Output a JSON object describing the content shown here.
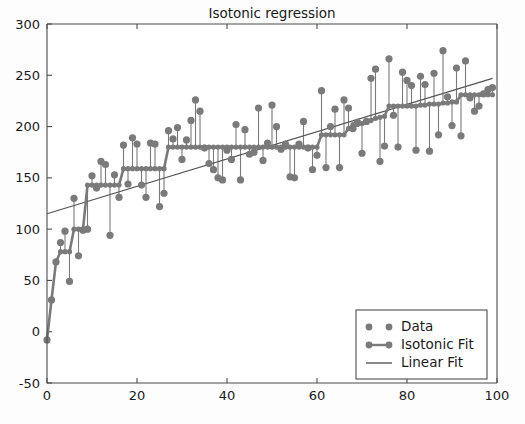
{
  "chart_data": {
    "type": "scatter",
    "title": "Isotonic regression",
    "xlabel": "",
    "ylabel": "",
    "xlim": [
      0,
      100
    ],
    "ylim": [
      -50,
      300
    ],
    "grid": false,
    "legend_position": "lower right",
    "xticks": [
      0,
      20,
      40,
      60,
      80,
      100
    ],
    "yticks": [
      -50,
      0,
      50,
      100,
      150,
      200,
      250,
      300
    ],
    "xtick_labels": [
      "0",
      "20",
      "40",
      "60",
      "80",
      "100"
    ],
    "ytick_labels": [
      "-50",
      "0",
      "50",
      "100",
      "150",
      "200",
      "250",
      "300"
    ],
    "marker_color": "#7a7a7a",
    "line_color": "#7a7a7a",
    "linear_fit_color": "#555555",
    "legend": [
      {
        "label": "Data",
        "style": "markers-only",
        "color": "#7a7a7a"
      },
      {
        "label": "Isotonic Fit",
        "style": "markers-with-line",
        "color": "#7a7a7a"
      },
      {
        "label": "Linear Fit",
        "style": "line-only",
        "color": "#555555"
      }
    ],
    "series": [
      {
        "name": "Data",
        "x": [
          0,
          1,
          2,
          3,
          4,
          5,
          6,
          7,
          8,
          9,
          10,
          11,
          12,
          13,
          14,
          15,
          16,
          17,
          18,
          19,
          20,
          21,
          22,
          23,
          24,
          25,
          26,
          27,
          28,
          29,
          30,
          31,
          32,
          33,
          34,
          35,
          36,
          37,
          38,
          39,
          40,
          41,
          42,
          43,
          44,
          45,
          46,
          47,
          48,
          49,
          50,
          51,
          52,
          53,
          54,
          55,
          56,
          57,
          58,
          59,
          60,
          61,
          62,
          63,
          64,
          65,
          66,
          67,
          68,
          69,
          70,
          71,
          72,
          73,
          74,
          75,
          76,
          77,
          78,
          79,
          80,
          81,
          82,
          83,
          84,
          85,
          86,
          87,
          88,
          89,
          90,
          91,
          92,
          93,
          94,
          95,
          96,
          97,
          98,
          99
        ],
        "y": [
          -8,
          31,
          68,
          87,
          98,
          49,
          130,
          74,
          99,
          100,
          152,
          140,
          166,
          163,
          94,
          153,
          131,
          182,
          144,
          189,
          183,
          143,
          131,
          184,
          183,
          122,
          135,
          196,
          188,
          199,
          168,
          187,
          206,
          226,
          215,
          179,
          164,
          158,
          150,
          148,
          177,
          168,
          202,
          148,
          197,
          173,
          175,
          218,
          167,
          184,
          221,
          200,
          178,
          183,
          151,
          150,
          183,
          205,
          179,
          158,
          172,
          235,
          160,
          200,
          217,
          160,
          226,
          218,
          198,
          204,
          174,
          205,
          247,
          256,
          166,
          181,
          266,
          211,
          180,
          253,
          245,
          240,
          177,
          249,
          241,
          176,
          252,
          192,
          274,
          229,
          201,
          257,
          191,
          264,
          228,
          215,
          220,
          232,
          236,
          238
        ]
      },
      {
        "name": "Isotonic Fit",
        "x": [
          0,
          1,
          2,
          3,
          4,
          5,
          6,
          7,
          8,
          9,
          10,
          11,
          12,
          13,
          14,
          15,
          16,
          17,
          18,
          19,
          20,
          21,
          22,
          23,
          24,
          25,
          26,
          27,
          28,
          29,
          30,
          31,
          32,
          33,
          34,
          35,
          36,
          37,
          38,
          39,
          40,
          41,
          42,
          43,
          44,
          45,
          46,
          47,
          48,
          49,
          50,
          51,
          52,
          53,
          54,
          55,
          56,
          57,
          58,
          59,
          60,
          61,
          62,
          63,
          64,
          65,
          66,
          67,
          68,
          69,
          70,
          71,
          72,
          73,
          74,
          75,
          76,
          77,
          78,
          79,
          80,
          81,
          82,
          83,
          84,
          85,
          86,
          87,
          88,
          89,
          90,
          91,
          92,
          93,
          94,
          95,
          96,
          97,
          98,
          99
        ],
        "y": [
          -8,
          31,
          68,
          78,
          78,
          78,
          100,
          100,
          100,
          143,
          143,
          143,
          143,
          143,
          143,
          143,
          143,
          159,
          159,
          159,
          159,
          159,
          159,
          159,
          159,
          159,
          159,
          180,
          180,
          180,
          180,
          180,
          180,
          180,
          180,
          180,
          180,
          180,
          180,
          180,
          180,
          180,
          180,
          180,
          180,
          180,
          180,
          180,
          180,
          180,
          180,
          180,
          180,
          180,
          180,
          180,
          180,
          180,
          180,
          180,
          180,
          192,
          192,
          192,
          192,
          192,
          192,
          198,
          202,
          202,
          203,
          204,
          206,
          208,
          209,
          210,
          220,
          220,
          220,
          220,
          220,
          220,
          220,
          221,
          221,
          222,
          222,
          222,
          223,
          223,
          224,
          224,
          231,
          231,
          231,
          231,
          231,
          231,
          231,
          231
        ]
      },
      {
        "name": "Linear Fit",
        "x": [
          0,
          99
        ],
        "y": [
          115,
          247
        ]
      }
    ]
  }
}
